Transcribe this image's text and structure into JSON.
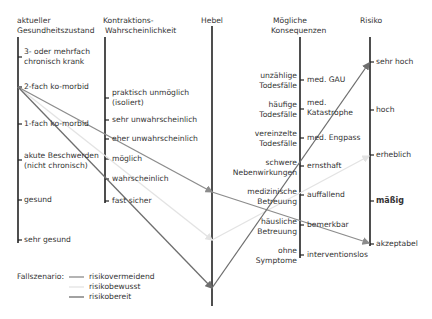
{
  "columns": {
    "gesundheit": {
      "header": [
        "aktueller",
        "Gesundheitszustand"
      ],
      "ticks": [
        {
          "label": [
            "3- oder mehrfach",
            "chronisch krank"
          ]
        },
        {
          "label": [
            "2-fach ko-morbid"
          ]
        },
        {
          "label": [
            "1-fach ko-morbid"
          ]
        },
        {
          "label": [
            "akute Beschwerden",
            "(nicht chronisch)"
          ]
        },
        {
          "label": [
            "gesund"
          ]
        },
        {
          "label": [
            "sehr gesund"
          ]
        }
      ]
    },
    "kontraktion": {
      "header": [
        "Kontraktions-",
        "Wahrscheinlichkeit"
      ],
      "ticks": [
        {
          "label": [
            "praktisch unmöglich",
            "(isoliert)"
          ]
        },
        {
          "label": [
            "sehr unwahrscheinlich"
          ]
        },
        {
          "label": [
            "eher unwahrscheinlich"
          ]
        },
        {
          "label": [
            "möglich"
          ]
        },
        {
          "label": [
            "wahrscheinlich"
          ]
        },
        {
          "label": [
            "fast sicher"
          ]
        }
      ]
    },
    "hebel": {
      "header": [
        "Hebel"
      ]
    },
    "konsequenzen": {
      "header": [
        "Mögliche",
        "Konsequenzen"
      ],
      "ticks": [
        {
          "left": [
            "unzählige",
            "Todesfälle"
          ],
          "right": [
            "med. GAU"
          ]
        },
        {
          "left": [
            "häufige",
            "Todesfälle"
          ],
          "right": [
            "med.",
            "Katastrophe"
          ]
        },
        {
          "left": [
            "vereinzelte",
            "Todesfälle"
          ],
          "right": [
            "med. Engpass"
          ]
        },
        {
          "left": [
            "schwere",
            "Nebenwirkungen"
          ],
          "right": [
            "ernsthaft"
          ]
        },
        {
          "left": [
            "medizinische",
            "Betreuung"
          ],
          "right": [
            "auffallend"
          ]
        },
        {
          "left": [
            "häusliche",
            "Betreuung"
          ],
          "right": [
            "bemerkbar"
          ]
        },
        {
          "left": [
            "ohne",
            "Symptome"
          ],
          "right": [
            "interventionslos"
          ]
        }
      ]
    },
    "risiko": {
      "header": [
        "Risiko"
      ],
      "ticks": [
        {
          "label": "sehr hoch"
        },
        {
          "label": "hoch"
        },
        {
          "label": "erheblich"
        },
        {
          "label": "mäßig",
          "emphasis": true
        },
        {
          "label": "akzeptabel"
        }
      ]
    }
  },
  "legend": {
    "title": "Fallszenario:",
    "items": [
      {
        "label": "risikovermeidend",
        "color": "#8c8c8c"
      },
      {
        "label": "risikobewusst",
        "color": "#e3e3e3"
      },
      {
        "label": "risikobereit",
        "color": "#6e6e6e"
      }
    ]
  },
  "scenarios": [
    {
      "name": "risikovermeidend",
      "color": "#8c8c8c",
      "path": [
        [
          18,
          87
        ],
        [
          212,
          192
        ],
        [
          372,
          240
        ]
      ]
    },
    {
      "name": "risikobewusst",
      "color": "#e3e3e3",
      "path": [
        [
          18,
          87
        ],
        [
          212,
          240
        ],
        [
          372,
          155
        ]
      ]
    },
    {
      "name": "risikobereit",
      "color": "#6e6e6e",
      "path": [
        [
          18,
          87
        ],
        [
          212,
          288
        ],
        [
          372,
          62
        ]
      ]
    }
  ]
}
